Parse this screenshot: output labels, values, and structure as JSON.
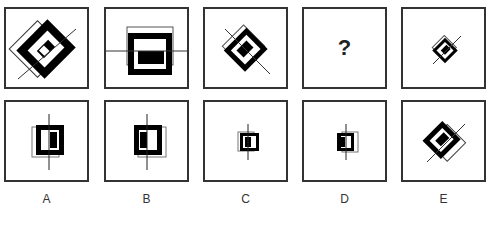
{
  "header": {
    "clipped_instruction_text": "... figure ... sequence ... complete ..."
  },
  "sequence": {
    "panels": [
      {
        "index": 1,
        "description": "large rotated 45deg thick black square ring with inner rectangle, thin outline square offset, diagonal line"
      },
      {
        "index": 2,
        "description": "upright thick black square ring with inner bar, thin outline square offset up, horizontal line"
      },
      {
        "index": 3,
        "description": "medium rotated 45deg thick black square ring, thin outline square, diagonal line"
      },
      {
        "index": 4,
        "description": "missing",
        "symbol": "?"
      },
      {
        "index": 5,
        "description": "small rotated 45deg thick black square ring, thin outline square, diagonal line"
      }
    ]
  },
  "options": {
    "items": [
      {
        "label": "A",
        "description": "upright black ring with inner half-filled bar, thin outline offset left, vertical line"
      },
      {
        "label": "B",
        "description": "upright black ring with inner half-filled bar, thin outline offset right, vertical line"
      },
      {
        "label": "C",
        "description": "small upright black ring, thin outline offset left, vertical line"
      },
      {
        "label": "D",
        "description": "small upright black ring, thin outline offset right, vertical line"
      },
      {
        "label": "E",
        "description": "rotated 45deg black ring, thin outline offset down-right, diagonal line"
      }
    ]
  },
  "question_mark": "?",
  "colors": {
    "ink": "#000000",
    "border": "#333333",
    "thin_line": "#555555",
    "background": "#ffffff"
  }
}
